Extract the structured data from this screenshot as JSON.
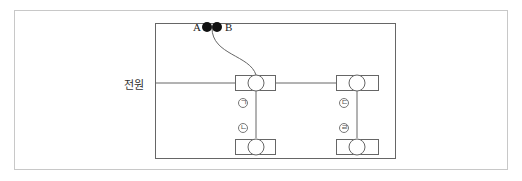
{
  "diagram": {
    "power_label": "전원",
    "connector": {
      "left_label": "A",
      "right_label": "B"
    },
    "sockets": [
      {
        "id": "top-left",
        "label": "㉠",
        "label_char": "ㄱ"
      },
      {
        "id": "bottom-left",
        "label": "㉡",
        "label_char": "ㄴ"
      },
      {
        "id": "top-right",
        "label": "㉢",
        "label_char": "ㄷ"
      },
      {
        "id": "bottom-right",
        "label": "㉣",
        "label_char": "ㄹ"
      }
    ],
    "colors": {
      "line": "#555555",
      "frame": "#c8c8c8",
      "dot": "#111111"
    }
  }
}
